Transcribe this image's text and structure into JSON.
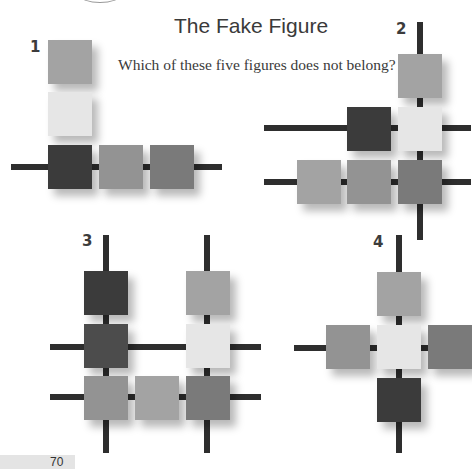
{
  "page": {
    "title": "The Fake Figure",
    "question": "Which of these five figures does not belong?",
    "page_number": "70"
  },
  "figures": [
    {
      "label": "1"
    },
    {
      "label": "2"
    },
    {
      "label": "3"
    },
    {
      "label": "4"
    }
  ],
  "colors": {
    "bar": "#2e2e2e",
    "dark": "#3b3b3b",
    "dark_mid": "#4c4c4c",
    "mid": "#7a7a7a",
    "mid_light": "#939393",
    "light": "#a3a3a3",
    "pale": "#e6e6e6",
    "page_strip": "#e4e4e4"
  }
}
